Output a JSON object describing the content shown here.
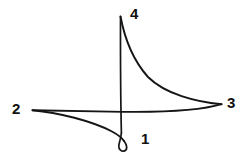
{
  "figure": {
    "kind": "hand-drawn-curve-diagram",
    "width": 248,
    "height": 155,
    "background_color": "#ffffff",
    "stroke_color": "#151515",
    "labels": [
      {
        "id": "vertex-1",
        "text": "1",
        "x": 141,
        "y": 131
      },
      {
        "id": "vertex-2",
        "text": "2",
        "x": 12,
        "y": 101
      },
      {
        "id": "vertex-3",
        "text": "3",
        "x": 227,
        "y": 95
      },
      {
        "id": "vertex-4",
        "text": "4",
        "x": 130,
        "y": 6
      }
    ],
    "vertices": [
      {
        "id": "cusp-1-loop",
        "label": "1",
        "x": 123,
        "y": 143,
        "type": "loop"
      },
      {
        "id": "cusp-2-left",
        "label": "2",
        "x": 32,
        "y": 110,
        "type": "cusp"
      },
      {
        "id": "cusp-3-right",
        "label": "3",
        "x": 222,
        "y": 104,
        "type": "cusp"
      },
      {
        "id": "cusp-4-top",
        "label": "4",
        "x": 120,
        "y": 16,
        "type": "cusp"
      }
    ],
    "strokes": [
      {
        "id": "stroke-top-to-right",
        "description": "concave curve from top cusp 4 sweeping down and right into cusp 3",
        "d": "M 120.5 16.5 C 124 35 131 58 148 77 C 165 94 196 102 221.5 104.2"
      },
      {
        "id": "stroke-right-to-left",
        "description": "long near-horizontal stroke from cusp 3 running left, dipping slightly, into cusp 2",
        "d": "M 221.5 104.2 C 196 112 150 112.5 110 111.6 C 80 111 52 110.4 32.5 110.2"
      },
      {
        "id": "stroke-left-to-loop",
        "description": "curve from cusp 2 bowing downward to the right into the small loop at vertex 1",
        "d": "M 32.5 110.2 C 58 112.5 92 121 112 131.5 C 119 135.3 122.5 138.5 124.2 141.2"
      },
      {
        "id": "stroke-loop",
        "description": "small closed loop drawn at vertex 1 where the curve crosses itself",
        "d": "M 124.2 141.2 C 127.3 145 127.6 149.8 124.6 150.9 C 121.6 152 118.5 149.3 118.8 145.7 C 119 142.6 120.6 140.2 121.4 133"
      },
      {
        "id": "stroke-loop-to-top",
        "description": "near-vertical stroke rising from the loop up through the crossing to top cusp 4",
        "d": "M 121.4 133 C 120.9 112 120.4 62 120.5 16.5"
      }
    ]
  }
}
